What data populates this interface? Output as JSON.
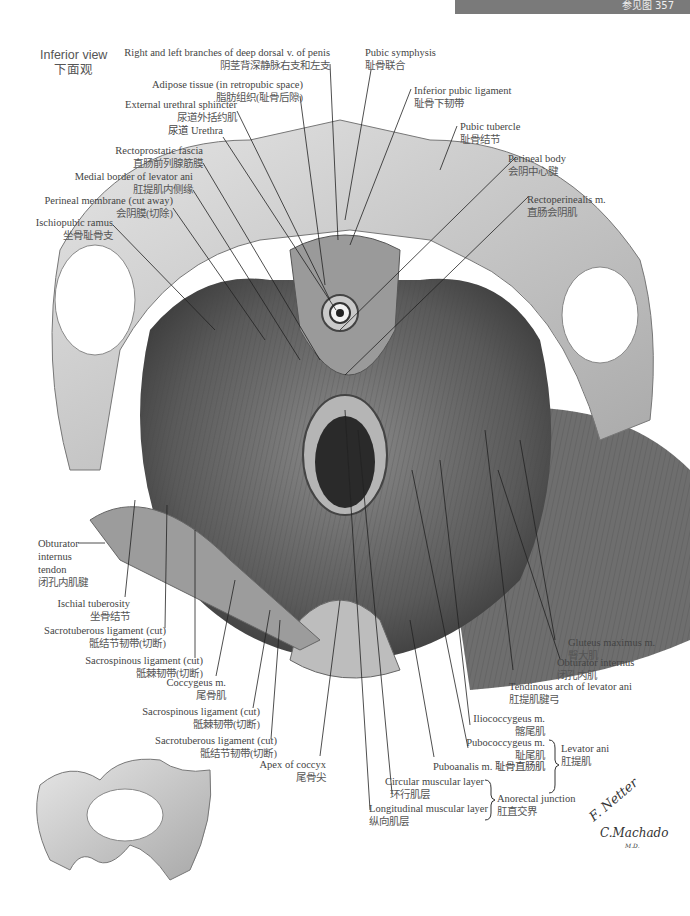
{
  "header": {
    "banner_text": "参见图 357"
  },
  "view": {
    "en": "Inferior view",
    "cn": "下面观"
  },
  "labels": {
    "deep_dorsal": {
      "en": "Right and left branches of deep dorsal v. of penis",
      "cn": "阴茎背深静脉右支和左支"
    },
    "adipose": {
      "en": "Adipose tissue (in retropubic space)",
      "cn": "脂肪组织(耻骨后隙)"
    },
    "ext_urethral": {
      "en": "External urethral sphincter",
      "cn": "尿道外括约肌"
    },
    "urethra": {
      "en": "尿道 Urethra"
    },
    "rectoprostatic": {
      "en": "Rectoprostatic fascia",
      "cn": "直肠前列腺筋膜"
    },
    "medial_border": {
      "en": "Medial border of levator ani",
      "cn": "肛提肌内侧缘"
    },
    "perineal_membrane": {
      "en": "Perineal membrane (cut away)",
      "cn": "会阴膜(切除)"
    },
    "ischiopubic": {
      "en": "Ischiopubic ramus",
      "cn": "坐骨耻骨支"
    },
    "pubic_symphysis": {
      "en": "Pubic symphysis",
      "cn": "耻骨联合"
    },
    "inferior_pubic": {
      "en": "Inferior pubic ligament",
      "cn": "耻骨下韧带"
    },
    "pubic_tubercle": {
      "en": "Pubic tubercle",
      "cn": "耻骨结节"
    },
    "perineal_body": {
      "en": "Perineal body",
      "cn": "会阴中心腱"
    },
    "rectoperinealis": {
      "en": "Rectoperinealis m.",
      "cn": "直肠会阴肌"
    },
    "obturator_tendon": {
      "en1": "Obturator",
      "en2": "internus",
      "en3": "tendon",
      "cn": "闭孔内肌腱"
    },
    "ischial_tuberosity": {
      "en": "Ischial tuberosity",
      "cn": "坐骨结节"
    },
    "sacrotuberous_1": {
      "en": "Sacrotuberous ligament (cut)",
      "cn": "骶结节韧带(切断)"
    },
    "sacrospinous_1": {
      "en": "Sacrospinous ligament (cut)",
      "cn": "骶棘韧带(切断)"
    },
    "coccygeus": {
      "en": "Coccygeus m.",
      "cn": "尾骨肌"
    },
    "sacrospinous_2": {
      "en": "Sacrospinous ligament (cut)",
      "cn": "骶棘韧带(切断)"
    },
    "sacrotuberous_2": {
      "en": "Sacrotuberous ligament (cut)",
      "cn": "骶结节韧带(切断)"
    },
    "apex_coccyx": {
      "en": "Apex of coccyx",
      "cn": "尾骨尖"
    },
    "gluteus": {
      "en": "Gluteus maximus m.",
      "cn": "臀大肌"
    },
    "obturator_internus": {
      "en": "Obturator internus",
      "cn": "闭孔内肌"
    },
    "tendinous_arch": {
      "en": "Tendinous arch of levator ani",
      "cn": "肛提肌腱弓"
    },
    "iliococcygeus": {
      "en": "Iliococcygeus m.",
      "cn": "髂尾肌"
    },
    "pubococcygeus": {
      "en": "Pubococcygeus m.",
      "cn": "耻尾肌"
    },
    "puboanalis": {
      "en": "Puboanalis m. 耻骨直肠肌"
    },
    "levator_ani": {
      "en": "Levator ani",
      "cn": "肛提肌"
    },
    "circular": {
      "en": "Circular muscular layer",
      "cn": "环行肌层"
    },
    "longitudinal": {
      "en": "Longitudinal muscular layer",
      "cn": "纵向肌层"
    },
    "anorectal": {
      "en": "Anorectal junction",
      "cn": "肛直交界"
    }
  },
  "signatures": {
    "netter": "F. Netter",
    "netter_md": "M.D.",
    "machado": "C.Machado",
    "machado_md": "M.D."
  }
}
